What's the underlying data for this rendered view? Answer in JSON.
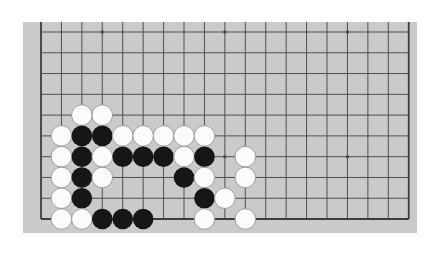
{
  "page": {
    "width": 446,
    "height": 254,
    "background_color": "#ffffff"
  },
  "board": {
    "description": "partial 19x19 go board diagram, bottom-left area, top edge cut mid-cell",
    "surface_color": "#cacaca",
    "line_color": "#4f4f4f",
    "edge_line_color": "#3c3c3c",
    "rect": {
      "left": 23,
      "top": 22,
      "width": 394,
      "height": 211
    },
    "grid": {
      "cols": 19,
      "rows_visible": 10,
      "x0": 18,
      "dx": 20.43,
      "y0": 10,
      "dy": 20.78,
      "top_cut": true,
      "line_width": 1,
      "edge_line_width": 1.8
    },
    "stone_radius": 10.3,
    "star_radius": 1.8,
    "stone_colors": {
      "black_fill": "#161616",
      "white_fill": "#fbfbfb",
      "white_stroke": "#9e9e9e"
    },
    "stars": [
      {
        "col": 3,
        "row": 0
      },
      {
        "col": 9,
        "row": 0
      },
      {
        "col": 15,
        "row": 0
      },
      {
        "col": 9,
        "row": 6
      },
      {
        "col": 15,
        "row": 6
      }
    ],
    "stones": [
      {
        "col": 2,
        "row": 4,
        "color": "white"
      },
      {
        "col": 3,
        "row": 4,
        "color": "white"
      },
      {
        "col": 1,
        "row": 5,
        "color": "white"
      },
      {
        "col": 2,
        "row": 5,
        "color": "black"
      },
      {
        "col": 3,
        "row": 5,
        "color": "black"
      },
      {
        "col": 4,
        "row": 5,
        "color": "white"
      },
      {
        "col": 5,
        "row": 5,
        "color": "white"
      },
      {
        "col": 6,
        "row": 5,
        "color": "white"
      },
      {
        "col": 7,
        "row": 5,
        "color": "white"
      },
      {
        "col": 8,
        "row": 5,
        "color": "white"
      },
      {
        "col": 1,
        "row": 6,
        "color": "white"
      },
      {
        "col": 2,
        "row": 6,
        "color": "black"
      },
      {
        "col": 3,
        "row": 6,
        "color": "white"
      },
      {
        "col": 4,
        "row": 6,
        "color": "black"
      },
      {
        "col": 5,
        "row": 6,
        "color": "black"
      },
      {
        "col": 6,
        "row": 6,
        "color": "black"
      },
      {
        "col": 7,
        "row": 6,
        "color": "white"
      },
      {
        "col": 8,
        "row": 6,
        "color": "black"
      },
      {
        "col": 10,
        "row": 6,
        "color": "white"
      },
      {
        "col": 1,
        "row": 7,
        "color": "white"
      },
      {
        "col": 2,
        "row": 7,
        "color": "black"
      },
      {
        "col": 3,
        "row": 7,
        "color": "white"
      },
      {
        "col": 7,
        "row": 7,
        "color": "black"
      },
      {
        "col": 8,
        "row": 7,
        "color": "white"
      },
      {
        "col": 10,
        "row": 7,
        "color": "white"
      },
      {
        "col": 1,
        "row": 8,
        "color": "white"
      },
      {
        "col": 2,
        "row": 8,
        "color": "black"
      },
      {
        "col": 8,
        "row": 8,
        "color": "black"
      },
      {
        "col": 9,
        "row": 8,
        "color": "white"
      },
      {
        "col": 1,
        "row": 9,
        "color": "white"
      },
      {
        "col": 2,
        "row": 9,
        "color": "white"
      },
      {
        "col": 3,
        "row": 9,
        "color": "black"
      },
      {
        "col": 4,
        "row": 9,
        "color": "black"
      },
      {
        "col": 5,
        "row": 9,
        "color": "black"
      },
      {
        "col": 8,
        "row": 9,
        "color": "white"
      },
      {
        "col": 10,
        "row": 9,
        "color": "white"
      }
    ]
  }
}
